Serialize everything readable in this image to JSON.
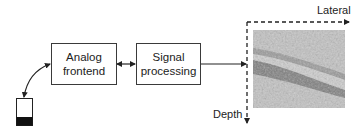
{
  "diagram": {
    "blocks": [
      {
        "id": "analog",
        "lines": [
          "Analog",
          "frontend"
        ]
      },
      {
        "id": "signal",
        "lines": [
          "Signal",
          "processing"
        ]
      }
    ],
    "axes": {
      "horizontal_label": "Lateral",
      "vertical_label": "Depth"
    },
    "connections": [
      {
        "from": "probe",
        "to": "analog",
        "type": "curved-bidirectional"
      },
      {
        "from": "analog",
        "to": "signal",
        "type": "bidirectional"
      },
      {
        "from": "signal",
        "to": "image",
        "type": "unidirectional"
      }
    ],
    "colors": {
      "stroke": "#222222",
      "image_base": "#bdbdbd",
      "image_dark_band": "#6b6b6b"
    }
  }
}
